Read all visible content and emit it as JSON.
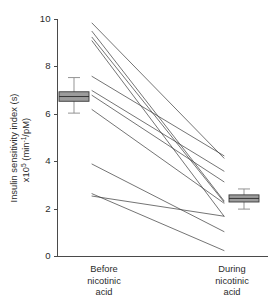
{
  "chart_data": {
    "type": "line",
    "title": "",
    "subtitle": "",
    "xlabel": "",
    "ylabel_line1": "Insulin sensitivity index (s)",
    "ylabel_line2_prefix": "x10",
    "ylabel_line2_exp": "5",
    "ylabel_line2_mid": " (min",
    "ylabel_line2_exp2": "-1",
    "ylabel_line2_suffix": "/pM)",
    "ylabel_full": "Insulin sensitivity index (s) x10^5 (min^-1/pM)",
    "grid": false,
    "legend": "none",
    "ylim": [
      0,
      10
    ],
    "ytick_values": [
      0,
      2,
      4,
      6,
      8,
      10
    ],
    "ytick_labels": [
      "0",
      "2",
      "4",
      "6",
      "8",
      "10"
    ],
    "categories": [
      "Before nicotinic acid",
      "During nicotinic acid"
    ],
    "category_labels": [
      [
        "Before",
        "nicotinic",
        "acid"
      ],
      [
        "During",
        "nicotinic",
        "acid"
      ]
    ],
    "x_positions": [
      0,
      1
    ],
    "series_description": "Paired individual subject trajectories (spaghetti plot) from before to during nicotinic acid treatment",
    "series": [
      {
        "name": "subject-1",
        "values": [
          9.85,
          4.15
        ]
      },
      {
        "name": "subject-2",
        "values": [
          9.5,
          2.35
        ]
      },
      {
        "name": "subject-3",
        "values": [
          9.25,
          2.3
        ]
      },
      {
        "name": "subject-4",
        "values": [
          9.1,
          1.7
        ]
      },
      {
        "name": "subject-5",
        "values": [
          7.6,
          4.25
        ]
      },
      {
        "name": "subject-6",
        "values": [
          7.0,
          3.6
        ]
      },
      {
        "name": "subject-7",
        "values": [
          6.8,
          3.15
        ]
      },
      {
        "name": "subject-8",
        "values": [
          6.2,
          2.25
        ]
      },
      {
        "name": "subject-9",
        "values": [
          3.9,
          1.05
        ]
      },
      {
        "name": "subject-10",
        "values": [
          2.65,
          0.25
        ]
      },
      {
        "name": "subject-11",
        "values": [
          2.55,
          1.7
        ]
      }
    ],
    "summary_boxes": [
      {
        "name": "before-summary-box",
        "category": "Before nicotinic acid",
        "median": 6.75,
        "box_low": 6.55,
        "box_high": 6.95,
        "whisker_low": 6.05,
        "whisker_high": 7.55
      },
      {
        "name": "during-summary-box",
        "category": "During nicotinic acid",
        "median": 2.45,
        "box_low": 2.3,
        "box_high": 2.6,
        "whisker_low": 2.0,
        "whisker_high": 2.85
      }
    ],
    "colors": {
      "line": "#3d3d3d",
      "box_fill": "#9c9c9c",
      "box_stroke": "#3a3a3a",
      "axis": "#4a4a4a",
      "text": "#2b2b2b",
      "background": "#ffffff"
    }
  }
}
